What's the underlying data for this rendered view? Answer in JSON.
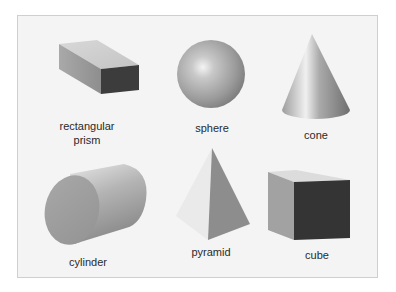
{
  "figure": {
    "type": "3D geometric solids illustration",
    "background": "#f4f4f4",
    "border": "#cfcfcf",
    "shapes": [
      {
        "id": "rectangular-prism",
        "label_line1": "rectangular",
        "label_line2": "prism"
      },
      {
        "id": "sphere",
        "label": "sphere"
      },
      {
        "id": "cone",
        "label": "cone"
      },
      {
        "id": "cylinder",
        "label": "cylinder"
      },
      {
        "id": "pyramid",
        "label": "pyramid"
      },
      {
        "id": "cube",
        "label": "cube"
      }
    ]
  }
}
